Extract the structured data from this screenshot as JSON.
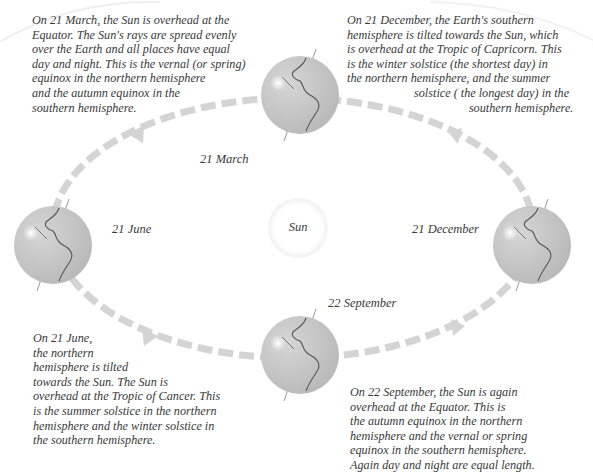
{
  "diagram": {
    "center": {
      "label": "Sun"
    },
    "colors": {
      "orbit_dash": "#d4d4d4",
      "globe_fill": "#c9c9c9",
      "coastline": "#555555",
      "text": "#3a3a3a",
      "background": "#ffffff"
    },
    "positions": [
      {
        "id": "march",
        "label": "21 March",
        "description": "On 21 March, the Sun is overhead at the\nEquator. The Sun's rays are spread evenly\nover the Earth and all places have equal\nday and night. This is the vernal (or spring)\nequinox in the northern hemisphere\nand the autumn equinox in the\nsouthern hemisphere."
      },
      {
        "id": "december",
        "label": "21 December",
        "description": "On 21 December, the Earth's southern\nhemisphere is tilted towards the Sun, which\nis overhead at the Tropic of Capricorn. This\nis the winter solstice (the shortest day) in\nthe northern hemisphere, and the summer\n                      solstice ( the longest day) in the\n                                        southern hemisphere."
      },
      {
        "id": "june",
        "label": "21 June",
        "description": "On 21 June,\nthe northern\nhemisphere is tilted\ntowards the Sun. The Sun is\noverhead at the Tropic of Cancer. This\nis the summer solstice in the northern\nhemisphere and the winter solstice in\nthe southern hemisphere."
      },
      {
        "id": "september",
        "label": "22 September",
        "description": "On 22 September, the Sun is again\noverhead at the Equator. This is\nthe autumn equinox in the northern\nhemisphere and the vernal or spring\nequinox in the southern hemisphere.\nAgain day and night are equal length."
      }
    ],
    "orbit_direction": "counter-clockwise (March → June → September → December)"
  }
}
